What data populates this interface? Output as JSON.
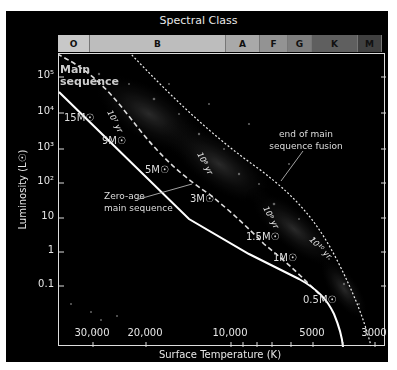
{
  "title": "Spectral Class",
  "spectral_classes": [
    {
      "label": "O",
      "color": "#c8c8c8",
      "width": 32
    },
    {
      "label": "B",
      "color": "#bdbdbd",
      "width": 136
    },
    {
      "label": "A",
      "color": "#a9a9a9",
      "width": 34
    },
    {
      "label": "F",
      "color": "#939393",
      "width": 28
    },
    {
      "label": "G",
      "color": "#7e7e7e",
      "width": 24
    },
    {
      "label": "K",
      "color": "#5f5f5f",
      "width": 46
    },
    {
      "label": "M",
      "color": "#404040",
      "width": 24
    }
  ],
  "axes": {
    "ylabel": "Luminosity (L☉)",
    "xlabel": "Surface Temperature (K)",
    "yticks": [
      "10⁵",
      "10⁴",
      "10³",
      "10²",
      "10",
      "1",
      "0.1"
    ],
    "xticks": [
      "30,000",
      "20,000",
      "10,000",
      "5000",
      "3000"
    ]
  },
  "labels": {
    "main_sequence": "Main sequence",
    "main_sequence_line1": "Main",
    "main_sequence_line2": "sequence",
    "zams_line1": "Zero-age",
    "zams_line2": "main sequence",
    "end_fusion_line1": "end of main",
    "end_fusion_line2": "sequence fusion",
    "iso_1e7": "10⁷ yr",
    "iso_1e8": "10⁸ yr",
    "iso_1e9": "10⁹ yr",
    "iso_1e10": "10¹⁰ yr"
  },
  "masses": [
    "15M☉",
    "9M☉",
    "5M☉",
    "3M☉",
    "1.5M☉",
    "1M☉",
    "0.5M☉"
  ],
  "chart_data": {
    "type": "scatter",
    "title": "Spectral Class",
    "xlabel": "Surface Temperature (K)",
    "ylabel": "Luminosity (L☉)",
    "x_scale": "log, reversed",
    "y_scale": "log",
    "xlim": [
      40000,
      2700
    ],
    "ylim": [
      0.02,
      300000
    ],
    "xticks": [
      30000,
      20000,
      10000,
      5000,
      3000
    ],
    "yticks": [
      0.1,
      1,
      10,
      100,
      1000,
      10000,
      100000
    ],
    "spectral_classes": [
      "O",
      "B",
      "A",
      "F",
      "G",
      "K",
      "M"
    ],
    "series": [
      {
        "name": "Zero-age main sequence",
        "style": "solid",
        "points": [
          [
            40000,
            50000
          ],
          [
            30000,
            20000
          ],
          [
            20000,
            3000
          ],
          [
            13000,
            300
          ],
          [
            10000,
            60
          ],
          [
            7000,
            5
          ],
          [
            5800,
            1
          ],
          [
            4500,
            0.3
          ],
          [
            3800,
            0.04
          ]
        ]
      },
      {
        "name": "End of main sequence fusion",
        "style": "dotted",
        "points": [
          [
            32000,
            200000
          ],
          [
            20000,
            20000
          ],
          [
            12000,
            1500
          ],
          [
            8000,
            150
          ],
          [
            6000,
            10
          ],
          [
            4800,
            1.5
          ],
          [
            3800,
            0.2
          ],
          [
            3200,
            0.03
          ]
        ]
      }
    ],
    "isochrones": [
      "10⁷ yr",
      "10⁸ yr",
      "10⁹ yr",
      "10¹⁰ yr"
    ],
    "mass_labels": [
      {
        "mass": "15M☉",
        "L": 10000
      },
      {
        "mass": "9M☉",
        "L": 1000
      },
      {
        "mass": "5M☉",
        "L": 300
      },
      {
        "mass": "3M☉",
        "L": 60
      },
      {
        "mass": "1.5M☉",
        "L": 5
      },
      {
        "mass": "1M☉",
        "L": 1
      },
      {
        "mass": "0.5M☉",
        "L": 0.05
      }
    ],
    "annotations": [
      "Main sequence",
      "Zero-age main sequence",
      "end of main sequence fusion"
    ]
  }
}
